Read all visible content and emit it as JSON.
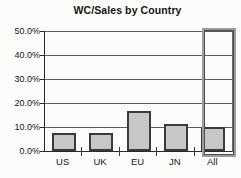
{
  "chart_data": {
    "type": "bar",
    "title": "WC/Sales by Country",
    "categories": [
      "US",
      "UK",
      "EU",
      "JN",
      "All"
    ],
    "values": [
      7.5,
      7.3,
      16.8,
      11.2,
      10.2
    ],
    "xlabel": "",
    "ylabel": "",
    "ylim": [
      0,
      50
    ],
    "y_tick_values": [
      50,
      40,
      30,
      20,
      10,
      0
    ],
    "y_tick_labels": [
      "50.0%",
      "40.0%",
      "30.0%",
      "20.0%",
      "10.0%",
      "0.0%"
    ],
    "grid": true,
    "legend_position": "none",
    "highlighted_category": "All",
    "colors": {
      "bar_fill": "#c7c7c7",
      "bar_border": "#3a3a3a",
      "gridline": "#5c5c5c",
      "axis": "#2a2a2a",
      "text": "#161616",
      "highlight_box_border": "#9c9c9c",
      "background": "#fcfcfb"
    }
  }
}
